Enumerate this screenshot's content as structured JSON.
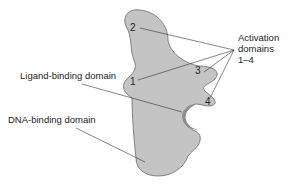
{
  "diagram": {
    "labels": {
      "activation": [
        "Activation",
        "domains",
        "1–4"
      ],
      "ligand": "Ligand-binding domain",
      "dna": "DNA-binding domain"
    },
    "numbers": [
      "1",
      "2",
      "3",
      "4"
    ],
    "colors": {
      "fill": "#c4c4c4",
      "stroke": "#6a6a6a",
      "pocket": "#8e8e8e",
      "line": "#333333"
    }
  }
}
